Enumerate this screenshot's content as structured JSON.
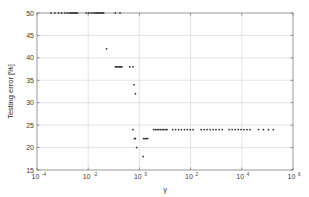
{
  "chart_data": {
    "type": "scatter",
    "title": "",
    "xlabel": "γ",
    "ylabel": "Testing error [%]",
    "xscale": "log",
    "yscale": "linear",
    "xlim": [
      0.0001,
      1000000
    ],
    "ylim": [
      15,
      50
    ],
    "grid": true,
    "legend": null,
    "marker": "dot",
    "marker_color": "#262626",
    "xticks": [
      {
        "value": 0.0001,
        "mantissa": "10",
        "exponent": "-4"
      },
      {
        "value": 0.01,
        "mantissa": "10",
        "exponent": "-2"
      },
      {
        "value": 1,
        "mantissa": "10",
        "exponent": "0"
      },
      {
        "value": 100,
        "mantissa": "10",
        "exponent": "2"
      },
      {
        "value": 10000,
        "mantissa": "10",
        "exponent": "4"
      },
      {
        "value": 1000000,
        "mantissa": "10",
        "exponent": "6"
      }
    ],
    "yticks": [
      15,
      20,
      25,
      30,
      35,
      40,
      45,
      50
    ],
    "series": [
      {
        "name": "testing error",
        "points": [
          [
            0.00035,
            50
          ],
          [
            0.0005,
            50
          ],
          [
            0.0007,
            50
          ],
          [
            0.00092,
            50
          ],
          [
            0.0012,
            50
          ],
          [
            0.0015,
            50
          ],
          [
            0.0018,
            50
          ],
          [
            0.00205,
            50
          ],
          [
            0.0023,
            50
          ],
          [
            0.00255,
            50
          ],
          [
            0.0028,
            50
          ],
          [
            0.0031,
            50
          ],
          [
            0.0034,
            50
          ],
          [
            0.0038,
            50
          ],
          [
            0.0085,
            50
          ],
          [
            0.0105,
            50
          ],
          [
            0.013,
            50
          ],
          [
            0.0155,
            50
          ],
          [
            0.018,
            50
          ],
          [
            0.0205,
            50
          ],
          [
            0.023,
            50
          ],
          [
            0.0255,
            50
          ],
          [
            0.0285,
            50
          ],
          [
            0.032,
            50
          ],
          [
            0.036,
            50
          ],
          [
            0.04,
            50
          ],
          [
            0.115,
            50
          ],
          [
            0.175,
            50
          ],
          [
            0.052,
            42
          ],
          [
            0.115,
            38
          ],
          [
            0.13,
            38
          ],
          [
            0.145,
            38
          ],
          [
            0.16,
            38
          ],
          [
            0.175,
            38
          ],
          [
            0.19,
            38
          ],
          [
            0.205,
            38
          ],
          [
            0.42,
            38
          ],
          [
            0.56,
            38
          ],
          [
            0.62,
            34
          ],
          [
            0.7,
            32
          ],
          [
            0.56,
            24
          ],
          [
            0.64,
            22
          ],
          [
            0.7,
            22
          ],
          [
            1.45,
            22
          ],
          [
            1.65,
            22
          ],
          [
            1.85,
            22
          ],
          [
            2.1,
            22
          ],
          [
            0.78,
            20
          ],
          [
            1.4,
            18
          ],
          [
            3.6,
            24
          ],
          [
            4.2,
            24
          ],
          [
            4.9,
            24
          ],
          [
            5.7,
            24
          ],
          [
            6.6,
            24
          ],
          [
            7.7,
            24
          ],
          [
            8.9,
            24
          ],
          [
            10.5,
            24
          ],
          [
            12.0,
            24
          ],
          [
            20.0,
            24
          ],
          [
            26.0,
            24
          ],
          [
            34.0,
            24
          ],
          [
            44.0,
            24
          ],
          [
            58.0,
            24
          ],
          [
            75.0,
            24
          ],
          [
            97.0,
            24
          ],
          [
            125.0,
            24
          ],
          [
            260.0,
            24
          ],
          [
            340.0,
            24
          ],
          [
            440.0,
            24
          ],
          [
            580.0,
            24
          ],
          [
            760.0,
            24
          ],
          [
            980.0,
            24
          ],
          [
            1300.0,
            24
          ],
          [
            1700.0,
            24
          ],
          [
            3200.0,
            24
          ],
          [
            4200.0,
            24
          ],
          [
            5500.0,
            24
          ],
          [
            7200.0,
            24
          ],
          [
            9400.0,
            24
          ],
          [
            12000.0,
            24
          ],
          [
            16000.0,
            24
          ],
          [
            21000.0,
            24
          ],
          [
            45000.0,
            24
          ],
          [
            70000.0,
            24
          ],
          [
            110000.0,
            24
          ],
          [
            170000.0,
            24
          ]
        ]
      }
    ]
  },
  "figure": {
    "plot_area": {
      "left": 37,
      "top": 13,
      "right": 293,
      "bottom": 170
    }
  }
}
